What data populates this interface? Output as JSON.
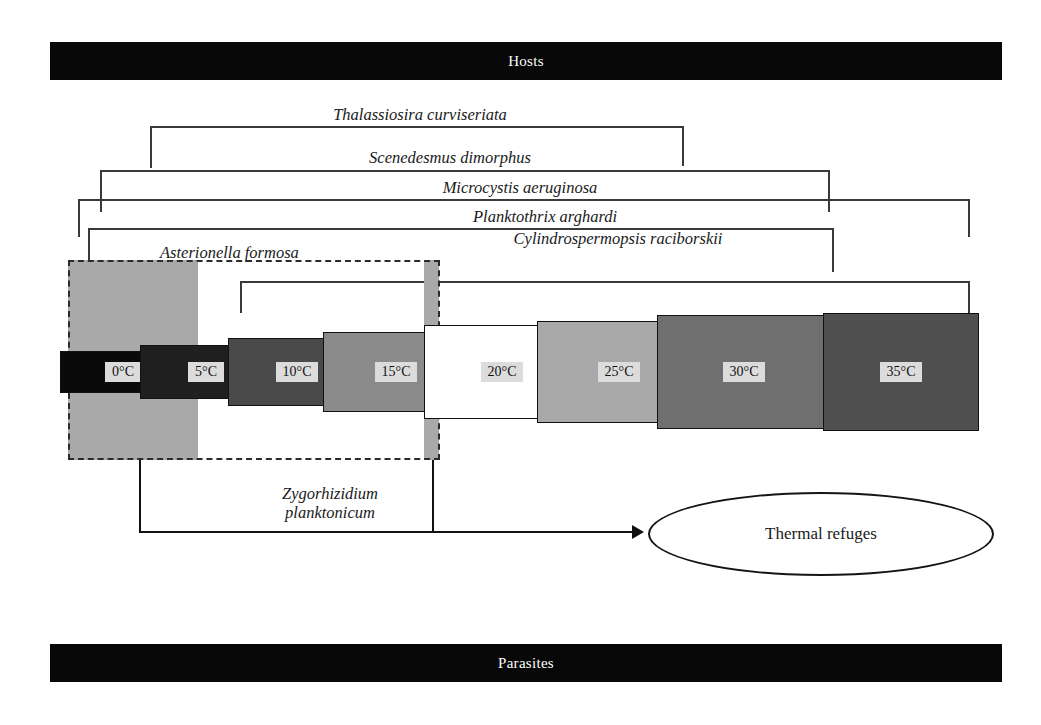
{
  "banners": {
    "hosts": "Hosts",
    "parasites": "Parasites"
  },
  "species_brackets": [
    {
      "name": "Thalassiosira curviseriata",
      "label": "Thalassiosira curviseriata",
      "label_x": 420,
      "label_y": 105,
      "left": 150,
      "right": 684,
      "top": 126,
      "drop_left": 42,
      "drop_right": 40
    },
    {
      "name": "Scenedesmus dimorphus",
      "label": "Scenedesmus dimorphus",
      "label_x": 450,
      "label_y": 148,
      "left": 100,
      "right": 830,
      "top": 170,
      "drop_left": 42,
      "drop_right": 42
    },
    {
      "name": "Microcystis aeruginosa",
      "label": "Microcystis aeruginosa",
      "label_x": 520,
      "label_y": 178,
      "left": 78,
      "right": 970,
      "top": 199,
      "drop_left": 38,
      "drop_right": 38
    },
    {
      "name": "Planktothrix arghardi",
      "label": "Planktothrix arghardi",
      "label_x": 545,
      "label_y": 207,
      "left": 88,
      "right": 834,
      "top": 228,
      "drop_left": 46,
      "drop_right": 44
    },
    {
      "name": "Cylindrospermopsis raciborskii",
      "label": "Cylindrospermopsis raciborskii",
      "label_x": 618,
      "label_y": 229,
      "left": 240,
      "right": 970,
      "top": 281,
      "drop_left": 32,
      "drop_right": 40
    }
  ],
  "asterionella": {
    "label": "Asterionella formosa",
    "label_x": 160,
    "label_y": 243
  },
  "zygorhizidium": {
    "line1": "Zygorhizidium",
    "line2": "planktonicum",
    "caption_x": 330,
    "caption_y": 484
  },
  "refuge_bands": [
    {
      "name": "refuge-band-left",
      "x": 68,
      "y": 260,
      "w": 130,
      "h": 200
    },
    {
      "name": "refuge-band-right",
      "x": 424,
      "y": 260,
      "w": 15,
      "h": 200
    }
  ],
  "zygo_box": {
    "x": 68,
    "y": 260,
    "w": 372,
    "h": 200
  },
  "temperatures": [
    {
      "label": "0°C",
      "x": 60,
      "y": 351,
      "w": 126,
      "h": 42,
      "fill": "#0a0a0a"
    },
    {
      "label": "5°C",
      "x": 140,
      "y": 345,
      "w": 132,
      "h": 54,
      "fill": "#1f1f1f"
    },
    {
      "label": "10°C",
      "x": 228,
      "y": 338,
      "w": 138,
      "h": 68,
      "fill": "#4a4a4a"
    },
    {
      "label": "15°C",
      "x": 323,
      "y": 332,
      "w": 146,
      "h": 80,
      "fill": "#8b8b8b"
    },
    {
      "label": "20°C",
      "x": 424,
      "y": 325,
      "w": 156,
      "h": 94,
      "fill": "#ffffff"
    },
    {
      "label": "25°C",
      "x": 537,
      "y": 321,
      "w": 164,
      "h": 102,
      "fill": "#a8a8a8"
    },
    {
      "label": "30°C",
      "x": 657,
      "y": 315,
      "w": 174,
      "h": 114,
      "fill": "#6f6f6f"
    },
    {
      "label": "35°C",
      "x": 823,
      "y": 313,
      "w": 156,
      "h": 118,
      "fill": "#4f4f4f"
    }
  ],
  "connectors": {
    "left_x": 139,
    "right_x": 432,
    "top_y": 460,
    "bottom_y": 531,
    "arrow_end_x": 632
  },
  "thermal_refuges": {
    "label": "Thermal refuges",
    "x": 648,
    "y": 492,
    "w": 342,
    "h": 80
  },
  "colors": {
    "banner_bg": "#080808",
    "banner_text": "#ffffff",
    "bracket_line": "#3a3a3a",
    "refuge_band": "#a9a9a9",
    "connector": "#111111",
    "temp_label_bg": "#dcdcdc"
  }
}
